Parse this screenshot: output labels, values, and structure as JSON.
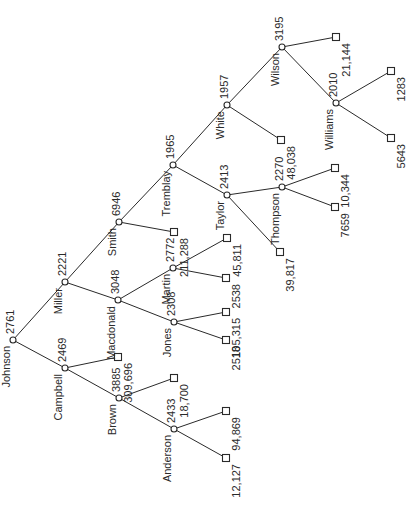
{
  "diagram": {
    "type": "tree",
    "orientation": "rotated-90-ccw",
    "colors": {
      "line": "#2a2a2a",
      "background": "#ffffff"
    },
    "nodes": [
      {
        "id": "johnson",
        "name": "Johnson",
        "value": "2761",
        "kind": "internal",
        "x": 13,
        "y": 340
      },
      {
        "id": "miller",
        "name": "Miller",
        "value": "2221",
        "kind": "internal",
        "x": 65,
        "y": 282
      },
      {
        "id": "campbell",
        "name": "Campbell",
        "value": "2469",
        "kind": "internal",
        "x": 65,
        "y": 368
      },
      {
        "id": "smith",
        "name": "Smith",
        "value": "6946",
        "kind": "internal",
        "x": 119,
        "y": 222
      },
      {
        "id": "macdonald",
        "name": "Macdonald",
        "value": "3048",
        "kind": "internal",
        "x": 118,
        "y": 300
      },
      {
        "id": "brown",
        "name": "Brown",
        "value": "3885",
        "kind": "internal",
        "x": 119,
        "y": 398
      },
      {
        "id": "tremblay",
        "name": "Tremblay",
        "value": "1965",
        "kind": "internal",
        "x": 173,
        "y": 165
      },
      {
        "id": "martin",
        "name": "Martin",
        "value": "2772",
        "kind": "internal",
        "x": 173,
        "y": 268
      },
      {
        "id": "jones",
        "name": "Jones",
        "value": "2308",
        "kind": "internal",
        "x": 174,
        "y": 322
      },
      {
        "id": "anderson",
        "name": "Anderson",
        "value": "2433",
        "kind": "internal",
        "x": 174,
        "y": 429
      },
      {
        "id": "white",
        "name": "White",
        "value": "1957",
        "kind": "internal",
        "x": 227,
        "y": 105
      },
      {
        "id": "taylor",
        "name": "Taylor",
        "value": "2413",
        "kind": "internal",
        "x": 227,
        "y": 195
      },
      {
        "id": "wilson",
        "name": "Wilson",
        "value": "3195",
        "kind": "internal",
        "x": 282,
        "y": 47
      },
      {
        "id": "thompson",
        "name": "Thompson",
        "value": "2270",
        "kind": "internal",
        "x": 282,
        "y": 187
      },
      {
        "id": "williams",
        "name": "Williams",
        "value": "2010",
        "kind": "internal",
        "x": 336,
        "y": 103
      },
      {
        "id": "leaf_macdonald_309696",
        "value": "309,696",
        "kind": "leaf",
        "x": 118,
        "y": 357
      },
      {
        "id": "leaf_smith_211288",
        "value": "211,288",
        "kind": "leaf",
        "x": 174,
        "y": 232
      },
      {
        "id": "leaf_brown_18700",
        "value": "18,700",
        "kind": "leaf",
        "x": 174,
        "y": 378
      },
      {
        "id": "leaf_anderson_94869",
        "value": "94,869",
        "kind": "leaf",
        "x": 226,
        "y": 411
      },
      {
        "id": "leaf_anderson_12127",
        "value": "12,127",
        "kind": "leaf",
        "x": 226,
        "y": 458
      },
      {
        "id": "leaf_martin_45811",
        "value": "45,811",
        "kind": "leaf",
        "x": 227,
        "y": 238
      },
      {
        "id": "leaf_martin_2538",
        "value": "2538",
        "kind": "leaf",
        "x": 226,
        "y": 278
      },
      {
        "id": "leaf_jones_105315",
        "value": "105,315",
        "kind": "leaf",
        "x": 226,
        "y": 312
      },
      {
        "id": "leaf_jones_2518",
        "value": "2518",
        "kind": "leaf",
        "x": 226,
        "y": 340
      },
      {
        "id": "leaf_white_48038",
        "value": "48,038",
        "kind": "leaf",
        "x": 281,
        "y": 140
      },
      {
        "id": "leaf_taylor_39817",
        "value": "39,817",
        "kind": "leaf",
        "x": 280,
        "y": 252
      },
      {
        "id": "leaf_wilson_21144",
        "value": "21,144",
        "kind": "leaf",
        "x": 336,
        "y": 37
      },
      {
        "id": "leaf_thompson_10344",
        "value": "10,344",
        "kind": "leaf",
        "x": 335,
        "y": 168
      },
      {
        "id": "leaf_thompson_7659",
        "value": "7659",
        "kind": "leaf",
        "x": 335,
        "y": 207
      },
      {
        "id": "leaf_williams_1283",
        "value": "1283",
        "kind": "leaf",
        "x": 391,
        "y": 71
      },
      {
        "id": "leaf_williams_5643",
        "value": "5643",
        "kind": "leaf",
        "x": 391,
        "y": 138
      }
    ],
    "edges": [
      [
        "johnson",
        "miller"
      ],
      [
        "johnson",
        "campbell"
      ],
      [
        "miller",
        "smith"
      ],
      [
        "miller",
        "macdonald"
      ],
      [
        "campbell",
        "leaf_macdonald_309696"
      ],
      [
        "campbell",
        "brown"
      ],
      [
        "smith",
        "tremblay"
      ],
      [
        "smith",
        "leaf_smith_211288"
      ],
      [
        "macdonald",
        "martin"
      ],
      [
        "macdonald",
        "jones"
      ],
      [
        "brown",
        "leaf_brown_18700"
      ],
      [
        "brown",
        "anderson"
      ],
      [
        "anderson",
        "leaf_anderson_94869"
      ],
      [
        "anderson",
        "leaf_anderson_12127"
      ],
      [
        "martin",
        "leaf_martin_45811"
      ],
      [
        "martin",
        "leaf_martin_2538"
      ],
      [
        "jones",
        "leaf_jones_105315"
      ],
      [
        "jones",
        "leaf_jones_2518"
      ],
      [
        "tremblay",
        "white"
      ],
      [
        "tremblay",
        "taylor"
      ],
      [
        "white",
        "wilson"
      ],
      [
        "white",
        "leaf_white_48038"
      ],
      [
        "taylor",
        "thompson"
      ],
      [
        "taylor",
        "leaf_taylor_39817"
      ],
      [
        "wilson",
        "leaf_wilson_21144"
      ],
      [
        "wilson",
        "williams"
      ],
      [
        "thompson",
        "leaf_thompson_10344"
      ],
      [
        "thompson",
        "leaf_thompson_7659"
      ],
      [
        "williams",
        "leaf_williams_1283"
      ],
      [
        "williams",
        "leaf_williams_5643"
      ]
    ]
  }
}
